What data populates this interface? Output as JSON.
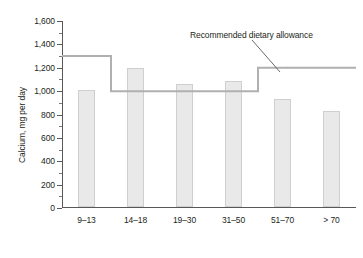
{
  "chart_data": {
    "type": "bar",
    "title": "",
    "xlabel": "Male, age in years",
    "ylabel": "Calcium, mg per day",
    "categories": [
      "9–13",
      "14–18",
      "19–30",
      "31–50",
      "51–70",
      "> 70"
    ],
    "values": [
      1000,
      1190,
      1055,
      1075,
      925,
      825
    ],
    "ylim": [
      0,
      1600
    ],
    "ytick_values": [
      0,
      200,
      400,
      600,
      800,
      1000,
      1200,
      1400,
      1600
    ],
    "ytick_labels": [
      "0",
      "200",
      "400",
      "600",
      "800",
      "1,000",
      "1,200",
      "1,400",
      "1,600"
    ],
    "yminor_step": 100,
    "grid": false,
    "legend": null,
    "series": [
      {
        "name": "Average calcium intake",
        "type": "bar",
        "values": [
          1000,
          1190,
          1055,
          1075,
          925,
          825
        ]
      },
      {
        "name": "Recommended dietary allowance",
        "type": "step",
        "values": [
          1300,
          1000,
          1000,
          1000,
          1200,
          1200
        ]
      }
    ],
    "annotations": [
      {
        "text": "Recommended dietary allowance",
        "points_to": "step up to 1,200 at age 51–70"
      }
    ],
    "colors": {
      "bar_fill": "#e9e9e9",
      "bar_border": "#cfcfcf",
      "rda_line": "#b0b0b0",
      "axis": "#58585b",
      "text": "#231f20",
      "background": "#ffffff"
    }
  },
  "axis": {
    "y_title": "Calcium, mg per day",
    "x_title": "Male, age in years"
  },
  "annotation": {
    "rda_label": "Recommended dietary allowance"
  }
}
